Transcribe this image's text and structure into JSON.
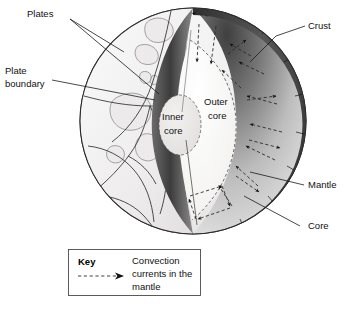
{
  "diagram": {
    "title_labels": {
      "plates": "Plates",
      "plate_boundary_line1": "Plate",
      "plate_boundary_line2": "boundary",
      "crust": "Crust",
      "mantle": "Mantle",
      "core": "Core",
      "inner_core_line1": "Inner",
      "inner_core_line2": "core",
      "outer_core_line1": "Outer",
      "outer_core_line2": "core"
    },
    "key": {
      "title": "Key",
      "entry_line1": "Convection",
      "entry_line2": "currents in the",
      "entry_line3": "mantle",
      "symbol": "dashed-arrow-icon"
    },
    "colors": {
      "mantle_dark": "#4e4e4e",
      "mantle_light": "#dcdcdc",
      "crust_dark": "#3b3b3b",
      "outer_core": "#f2f1f0",
      "inner_core": "#e4e3e2",
      "surface": "#efeeed",
      "ocean": "#f7f6f5",
      "stroke": "#2b2b2b",
      "background": "#ffffff"
    },
    "geometry": {
      "globe_center_x": 193,
      "globe_center_y": 121,
      "globe_radius": 113
    }
  }
}
